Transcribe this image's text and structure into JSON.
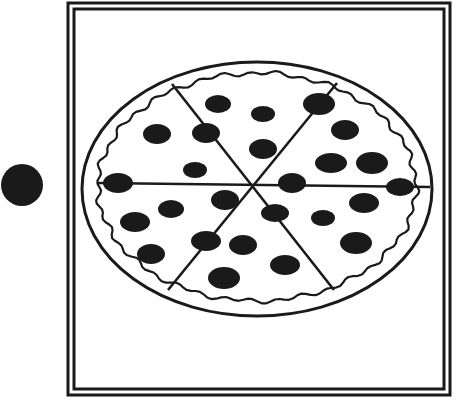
{
  "illustration": {
    "subject": "pizza",
    "slices": 6,
    "topping": "pepperoni",
    "colors": {
      "ink": "#1a1a1a",
      "background": "#ffffff"
    },
    "frame": {
      "outer": {
        "x": 68,
        "y": 3,
        "w": 382,
        "h": 392
      },
      "inner": {
        "x": 74,
        "y": 9,
        "w": 370,
        "h": 380
      }
    },
    "marker_dot": {
      "cx": 22,
      "cy": 185,
      "r": 21
    },
    "pizza": {
      "cx": 257,
      "cy": 189,
      "outer_rx": 175,
      "outer_ry": 127,
      "center": {
        "x": 252,
        "y": 185
      }
    },
    "cut_lines": [
      {
        "x1": 172,
        "y1": 84,
        "x2": 334,
        "y2": 290
      },
      {
        "x1": 337,
        "y1": 83,
        "x2": 168,
        "y2": 290
      },
      {
        "x1": 98,
        "y1": 183,
        "x2": 430,
        "y2": 187
      }
    ],
    "pepperoni": [
      {
        "cx": 218,
        "cy": 104,
        "rx": 13,
        "ry": 9
      },
      {
        "cx": 263,
        "cy": 114,
        "rx": 12,
        "ry": 8
      },
      {
        "cx": 319,
        "cy": 104,
        "rx": 16,
        "ry": 11
      },
      {
        "cx": 157,
        "cy": 134,
        "rx": 14,
        "ry": 10
      },
      {
        "cx": 206,
        "cy": 133,
        "rx": 14,
        "ry": 10
      },
      {
        "cx": 345,
        "cy": 130,
        "rx": 14,
        "ry": 10
      },
      {
        "cx": 263,
        "cy": 149,
        "rx": 14,
        "ry": 10
      },
      {
        "cx": 195,
        "cy": 170,
        "rx": 12,
        "ry": 8
      },
      {
        "cx": 331,
        "cy": 163,
        "rx": 16,
        "ry": 10
      },
      {
        "cx": 372,
        "cy": 163,
        "rx": 16,
        "ry": 11
      },
      {
        "cx": 118,
        "cy": 183,
        "rx": 15,
        "ry": 10
      },
      {
        "cx": 225,
        "cy": 200,
        "rx": 14,
        "ry": 10
      },
      {
        "cx": 292,
        "cy": 183,
        "rx": 14,
        "ry": 10
      },
      {
        "cx": 400,
        "cy": 187,
        "rx": 14,
        "ry": 9
      },
      {
        "cx": 171,
        "cy": 209,
        "rx": 13,
        "ry": 9
      },
      {
        "cx": 135,
        "cy": 222,
        "rx": 15,
        "ry": 10
      },
      {
        "cx": 275,
        "cy": 213,
        "rx": 14,
        "ry": 9
      },
      {
        "cx": 323,
        "cy": 218,
        "rx": 12,
        "ry": 8
      },
      {
        "cx": 364,
        "cy": 203,
        "rx": 15,
        "ry": 10
      },
      {
        "cx": 206,
        "cy": 241,
        "rx": 15,
        "ry": 10
      },
      {
        "cx": 243,
        "cy": 245,
        "rx": 14,
        "ry": 10
      },
      {
        "cx": 356,
        "cy": 243,
        "rx": 16,
        "ry": 11
      },
      {
        "cx": 151,
        "cy": 254,
        "rx": 14,
        "ry": 10
      },
      {
        "cx": 285,
        "cy": 265,
        "rx": 15,
        "ry": 10
      },
      {
        "cx": 224,
        "cy": 278,
        "rx": 16,
        "ry": 11
      }
    ]
  }
}
